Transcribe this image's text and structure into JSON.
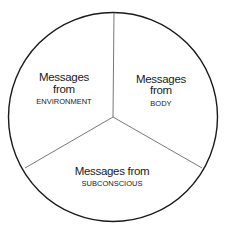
{
  "diagram": {
    "type": "circle-divided-into-three-sectors",
    "colors": {
      "outline": "#1a1a1a",
      "dividers": "#555555",
      "background": "#ffffff",
      "text": "#1a1a1a"
    },
    "sectors": [
      {
        "id": "environment",
        "line1": "Messages",
        "line2": "from",
        "line3": "ENVIRONMENT"
      },
      {
        "id": "body",
        "line1": "Messages",
        "line2": "from",
        "line3": "BODY"
      },
      {
        "id": "subconscious",
        "line1": "Messages from",
        "line2": "SUBCONSCIOUS"
      }
    ]
  }
}
